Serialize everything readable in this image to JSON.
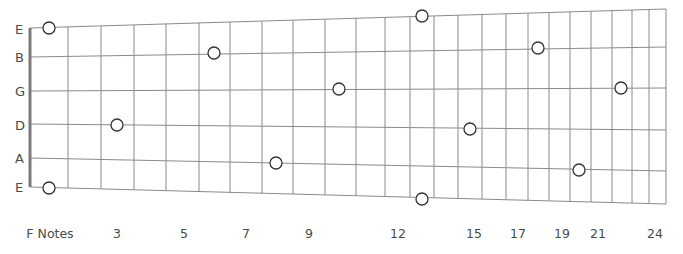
{
  "diagram": {
    "type": "guitar-fretboard",
    "title_label": "F Notes",
    "line_color": "#8a8a8a",
    "nut_color": "#7a7a7a",
    "marker_stroke": "#333333",
    "strings": [
      {
        "name": "E",
        "label_y": 22,
        "y_left": 28,
        "y_right": 9
      },
      {
        "name": "B",
        "label_y": 50,
        "y_left": 57,
        "y_right": 47
      },
      {
        "name": "G",
        "label_y": 84,
        "y_left": 91,
        "y_right": 88
      },
      {
        "name": "D",
        "label_y": 118,
        "y_left": 124,
        "y_right": 130
      },
      {
        "name": "A",
        "label_y": 151,
        "y_left": 158,
        "y_right": 171
      },
      {
        "name": "E",
        "label_y": 180,
        "y_left": 187,
        "y_right": 204
      }
    ],
    "nut_x": 30,
    "end_x": 666,
    "frets_x": [
      68,
      101,
      134,
      166,
      199,
      230,
      262,
      293,
      325,
      356,
      385,
      410,
      434,
      458,
      482,
      506,
      528,
      549,
      570,
      591,
      612,
      632,
      649,
      666
    ],
    "fret_labels": [
      {
        "text": "F Notes",
        "x": 50
      },
      {
        "text": "3",
        "x": 117
      },
      {
        "text": "5",
        "x": 184
      },
      {
        "text": "7",
        "x": 246
      },
      {
        "text": "9",
        "x": 309
      },
      {
        "text": "12",
        "x": 398
      },
      {
        "text": "15",
        "x": 474
      },
      {
        "text": "17",
        "x": 518
      },
      {
        "text": "19",
        "x": 562
      },
      {
        "text": "21",
        "x": 598
      },
      {
        "text": "24",
        "x": 655
      }
    ],
    "note_markers": [
      {
        "string": "E (high)",
        "fret": 1,
        "note": "F",
        "x": 49,
        "y": 28
      },
      {
        "string": "E (high)",
        "fret": 13,
        "note": "F",
        "x": 422,
        "y": 16
      },
      {
        "string": "B",
        "fret": 6,
        "note": "F",
        "x": 214,
        "y": 53
      },
      {
        "string": "B",
        "fret": 18,
        "note": "F",
        "x": 538,
        "y": 48
      },
      {
        "string": "G",
        "fret": 10,
        "note": "F",
        "x": 339,
        "y": 89
      },
      {
        "string": "G",
        "fret": 22,
        "note": "F",
        "x": 621,
        "y": 88
      },
      {
        "string": "D",
        "fret": 3,
        "note": "F",
        "x": 117,
        "y": 125
      },
      {
        "string": "D",
        "fret": 15,
        "note": "F",
        "x": 470,
        "y": 129
      },
      {
        "string": "A",
        "fret": 8,
        "note": "F",
        "x": 276,
        "y": 163
      },
      {
        "string": "A",
        "fret": 20,
        "note": "F",
        "x": 579,
        "y": 170
      },
      {
        "string": "E (low)",
        "fret": 1,
        "note": "F",
        "x": 49,
        "y": 188
      },
      {
        "string": "E (low)",
        "fret": 13,
        "note": "F",
        "x": 422,
        "y": 199
      }
    ]
  }
}
